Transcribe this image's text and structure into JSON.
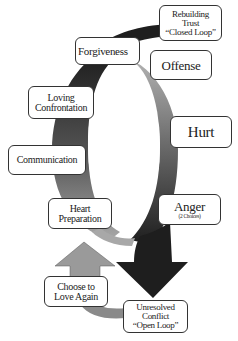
{
  "diagram": {
    "type": "cycle",
    "colors": {
      "dark_band": "#1e1e1e",
      "mid_band": "#6a6a6a",
      "light_band": "#a8a8a8",
      "box_border": "#333333",
      "background": "#ffffff"
    },
    "nodes": {
      "rebuilding_trust": {
        "line1": "Rebuilding",
        "line2": "Trust",
        "line3": "“Closed Loop”"
      },
      "forgiveness": {
        "label": "Forgiveness"
      },
      "offense": {
        "label": "Offense"
      },
      "loving_confrontation": {
        "line1": "Loving",
        "line2": "Confrontation"
      },
      "hurt": {
        "label": "Hurt"
      },
      "communication": {
        "label": "Communication"
      },
      "heart_preparation": {
        "line1": "Heart",
        "line2": "Preparation"
      },
      "anger": {
        "label": "Anger",
        "sub": "(2 Choices)"
      },
      "choose_to_love": {
        "line1": "Choose to",
        "line2": "Love Again"
      },
      "unresolved_conflict": {
        "line1": "Unresolved",
        "line2": "Conflict",
        "line3": "“Open Loop”"
      }
    },
    "edges": [
      {
        "from": "Offense",
        "to": "Hurt"
      },
      {
        "from": "Hurt",
        "to": "Anger"
      },
      {
        "from": "Anger",
        "to": "Unresolved Conflict",
        "style": "down-arrow"
      },
      {
        "from": "Unresolved Conflict",
        "to": "Choose to Love Again"
      },
      {
        "from": "Choose to Love Again",
        "to": "Heart Preparation",
        "style": "up-arrow"
      },
      {
        "from": "Heart Preparation",
        "to": "Communication"
      },
      {
        "from": "Communication",
        "to": "Loving Confrontation"
      },
      {
        "from": "Loving Confrontation",
        "to": "Forgiveness"
      },
      {
        "from": "Forgiveness",
        "to": "Rebuilding Trust"
      }
    ]
  }
}
